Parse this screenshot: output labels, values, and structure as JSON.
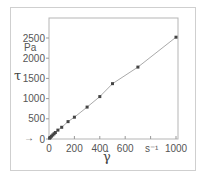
{
  "chart_data": {
    "type": "line",
    "title": "",
    "xlabel": "γ̇",
    "xunit": "s-1",
    "ylabel": "τ",
    "yunit": "Pa",
    "xlim": [
      0,
      1000
    ],
    "ylim": [
      0,
      2500
    ],
    "x_ticks": [
      0,
      200,
      400,
      600,
      1000
    ],
    "x_tick_labels": [
      "0",
      "200",
      "400",
      "600",
      "s-1",
      "1000"
    ],
    "y_ticks": [
      0,
      500,
      1000,
      1500,
      2000,
      2500
    ],
    "y_tick_labels": [
      "0",
      "500",
      "1000",
      "1500",
      "2000",
      "2500"
    ],
    "grid": false,
    "legend": null,
    "annotations": [
      "→ (arrow pointing to origin)"
    ],
    "series": [
      {
        "name": "shear stress vs shear rate",
        "marker": "square",
        "x": [
          5,
          10,
          20,
          30,
          40,
          50,
          70,
          100,
          150,
          200,
          300,
          400,
          500,
          700,
          1000
        ],
        "y": [
          20,
          40,
          70,
          100,
          130,
          160,
          220,
          290,
          430,
          540,
          790,
          1050,
          1370,
          1780,
          2520
        ]
      }
    ]
  },
  "labels": {
    "y_symbol": "τ",
    "y_unit": "Pa",
    "x_symbol": "γ̇",
    "x_unit": "s⁻¹",
    "arrow": "→"
  },
  "colors": {
    "line": "#aaaaaa",
    "marker": "#444444",
    "axis": "#999999",
    "frame": "#cfcfcf"
  }
}
